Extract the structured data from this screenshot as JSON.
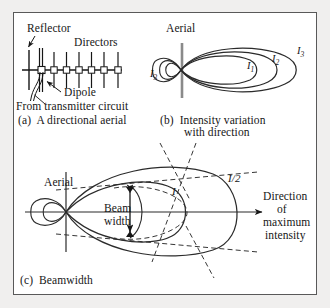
{
  "figure": {
    "background_color": "#f0efee",
    "panel_color": "#ffffff",
    "border_color": "#595959",
    "ink_color": "#161616"
  },
  "panel_a": {
    "caption": "(a)  A directional aerial",
    "labels": {
      "reflector": "Reflector",
      "directors": "Directors",
      "dipole": "Dipole",
      "feed": "From transmitter circuit"
    },
    "antenna": {
      "type": "yagi-uda",
      "reflector_count": 1,
      "dipole_count": 1,
      "director_count": 6
    }
  },
  "panel_b": {
    "caption_line1": "(b)  Intensity variation",
    "caption_line2": "with direction",
    "labels": {
      "aerial": "Aerial",
      "lobe_1": "I",
      "lobe_1_sub": "1",
      "lobe_2": "I",
      "lobe_2_sub": "2",
      "lobe_3": "I",
      "lobe_3_sub": "3",
      "back_lobe": "I",
      "back_lobe_sub": "3"
    },
    "lobe_count": 3
  },
  "panel_c": {
    "caption": "(c)  Beamwidth",
    "labels": {
      "aerial": "Aerial",
      "beam_width_line1": "Beam",
      "beam_width_line2": "width",
      "intensity_full": "I",
      "intensity_half": "I/2",
      "direction_line1": "Direction",
      "direction_line2": "of",
      "direction_line3": "maximum",
      "direction_line4": "intensity"
    }
  }
}
